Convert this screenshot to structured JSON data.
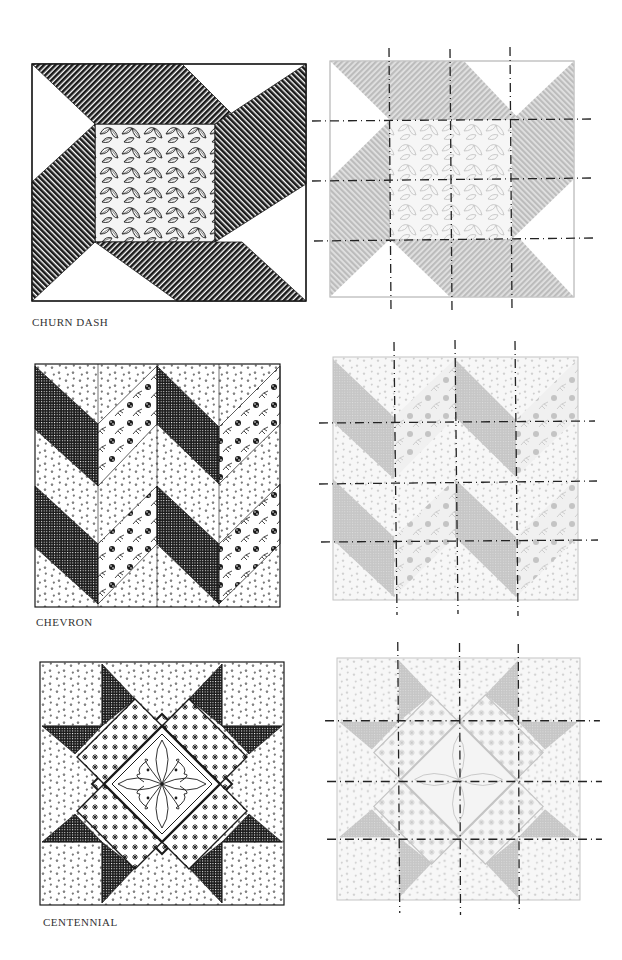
{
  "page": {
    "background": "#ffffff"
  },
  "colors": {
    "ink": "#1a1a1a",
    "faded_fill": "#c9c9c9",
    "faded_line": "#bdbdbd",
    "dash": "#222222",
    "label": "#333333"
  },
  "blocks": [
    {
      "name": "Churn Dash",
      "label": "CHURN DASH",
      "pattern": "churn-dash",
      "cut_grid": "3x3"
    },
    {
      "name": "Chevron",
      "label": "CHEVRON",
      "pattern": "chevron",
      "cut_grid": "3x3"
    },
    {
      "name": "Centennial",
      "label": "CENTENNIAL",
      "pattern": "centennial",
      "cut_grid": "3x3"
    }
  ]
}
